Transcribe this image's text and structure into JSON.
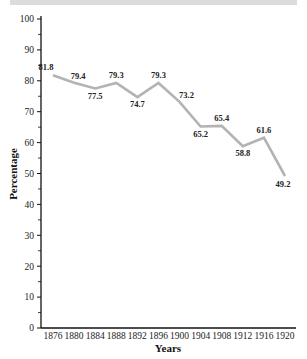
{
  "chart_data": {
    "type": "line",
    "title": "",
    "xlabel": "Years",
    "ylabel": "Percentage",
    "x": [
      1876,
      1880,
      1884,
      1888,
      1892,
      1896,
      1900,
      1904,
      1908,
      1912,
      1916,
      1920
    ],
    "categories": [
      "1876",
      "1880",
      "1884",
      "1888",
      "1892",
      "1896",
      "1900",
      "1904",
      "1908",
      "1912",
      "1916",
      "1920"
    ],
    "series": [
      {
        "name": "Percentage",
        "values": [
          81.8,
          79.4,
          77.5,
          79.3,
          74.7,
          79.3,
          73.2,
          65.2,
          65.4,
          58.8,
          61.6,
          49.2
        ]
      }
    ],
    "data_labels": [
      "81.8",
      "79.4",
      "77.5",
      "79.3",
      "74.7",
      "79.3",
      "73.2",
      "65.2",
      "65.4",
      "58.8",
      "61.6",
      "49.2"
    ],
    "ylim": [
      0,
      100
    ],
    "y_ticks": [
      0,
      10,
      20,
      30,
      40,
      50,
      60,
      70,
      80,
      90,
      100
    ],
    "y_minor_ticks": [
      5,
      15,
      25,
      35,
      45,
      55,
      65,
      75,
      85,
      95
    ],
    "grid": false,
    "legend": "none",
    "line_color": "#b3b3b3"
  },
  "colors": {
    "line": "#b3b3b3",
    "axis": "#111111",
    "top_bar": "#dcdcdc"
  }
}
